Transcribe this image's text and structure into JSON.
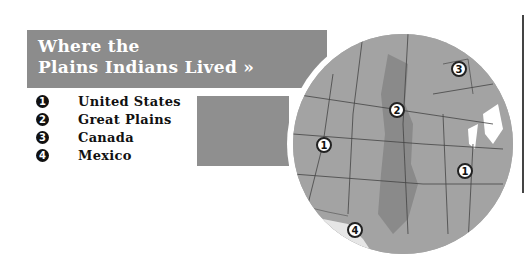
{
  "title": {
    "line1": "Where the",
    "line2": "Plains Indians Lived »"
  },
  "legend": [
    {
      "num": "1",
      "label": "United States"
    },
    {
      "num": "2",
      "label": "Great Plains"
    },
    {
      "num": "3",
      "label": "Canada"
    },
    {
      "num": "4",
      "label": "Mexico"
    }
  ],
  "map": {
    "markers": [
      {
        "num": "1",
        "region": "United States (west)"
      },
      {
        "num": "1",
        "region": "United States (east)"
      },
      {
        "num": "2",
        "region": "Great Plains"
      },
      {
        "num": "3",
        "region": "Canada"
      },
      {
        "num": "4",
        "region": "Mexico"
      }
    ],
    "colors": {
      "states": "#a3a3a3",
      "plains": "#8a8a8a",
      "mexico": "#e6e6e6",
      "lakes": "#ffffff",
      "banner": "#8c8c8c"
    }
  }
}
